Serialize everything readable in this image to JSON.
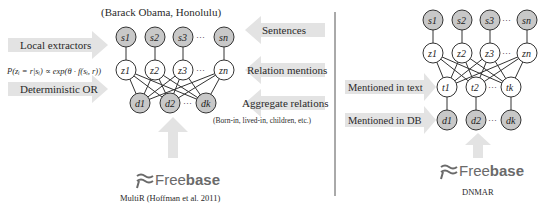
{
  "left_panel": {
    "title": "(Barack Obama, Honolulu)",
    "caption": "MultiR (Hoffman et al. 2011)",
    "left_labels": {
      "local_extractors": "Local extractors",
      "formula": "P(zᵢ = r|sᵢ) ∝ exp(θ · f(sᵢ, r))",
      "deterministic_or": "Deterministic OR"
    },
    "right_labels": {
      "sentences": "Sentences",
      "relation_mentions": "Relation mentions",
      "aggregate_relations": "Aggregate relations",
      "aggregate_examples": "(Born-in, lived-in, children, etc.)"
    },
    "nodes": {
      "s": [
        "s1",
        "s2",
        "s3",
        "sn"
      ],
      "z": [
        "z1",
        "z2",
        "z3",
        "zn"
      ],
      "d": [
        "d1",
        "d2",
        "dk"
      ]
    },
    "freebase": {
      "prefix": "Free",
      "suffix": "base"
    }
  },
  "right_panel": {
    "caption": "DNMAR",
    "left_labels": {
      "mentioned_in_text": "Mentioned in text",
      "mentioned_in_db": "Mentioned in DB"
    },
    "nodes": {
      "s": [
        "s1",
        "s2",
        "s3",
        "sn"
      ],
      "z": [
        "z1",
        "z2",
        "z3",
        "zn"
      ],
      "t": [
        "t1",
        "t2",
        "tk"
      ],
      "d": [
        "d1",
        "d2",
        "dk"
      ]
    },
    "freebase": {
      "prefix": "Free",
      "suffix": "base"
    }
  },
  "ellipsis": "···",
  "colors": {
    "arrow_fill": "#e3e3e3",
    "shaded_node": "#c8c8c8",
    "open_node": "#ffffff",
    "stroke": "#333333",
    "divider": "#555555",
    "freebase_logo": "#6a6a6a"
  }
}
